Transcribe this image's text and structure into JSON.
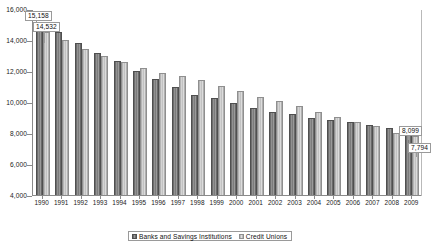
{
  "chart_data": {
    "type": "bar",
    "title": "",
    "xlabel": "",
    "ylabel": "",
    "ylim": [
      4000,
      16000
    ],
    "ytick_step": 2000,
    "ytick_labels": [
      "16,000",
      "14,000",
      "12,000",
      "10,000",
      "8,000",
      "6,000",
      "4,000"
    ],
    "ytick_values": [
      16000,
      14000,
      12000,
      10000,
      8000,
      6000,
      4000
    ],
    "grid": false,
    "legend_position": "bottom-center",
    "categories": [
      "1990",
      "1991",
      "1992",
      "1993",
      "1994",
      "1995",
      "1996",
      "1997",
      "1998",
      "1999",
      "2000",
      "2001",
      "2002",
      "2003",
      "2004",
      "2005",
      "2006",
      "2007",
      "2008",
      "2009"
    ],
    "series": [
      {
        "name": "Banks and Savings Institutions",
        "color": "#7c7c7c",
        "values": [
          15158,
          14500,
          13830,
          13170,
          12620,
          11990,
          11460,
          10960,
          10480,
          10230,
          9930,
          9630,
          9370,
          9200,
          8980,
          8830,
          8680,
          8540,
          8310,
          8099
        ]
      },
      {
        "name": "Credit Unions",
        "color": "#c8c8c8",
        "values": [
          14532,
          13980,
          13400,
          12960,
          12580,
          12220,
          11880,
          11670,
          11390,
          11040,
          10690,
          10350,
          10040,
          9730,
          9370,
          9040,
          8680,
          8430,
          7990,
          7794
        ]
      }
    ],
    "annotations": [
      {
        "label": "15,158",
        "series": "Banks and Savings Institutions",
        "category": "1990",
        "value": 15158
      },
      {
        "label": "14,532",
        "series": "Credit Unions",
        "category": "1990",
        "value": 14532
      },
      {
        "label": "8,099",
        "series": "Banks and Savings Institutions",
        "category": "2009",
        "value": 8099
      },
      {
        "label": "7,794",
        "series": "Credit Unions",
        "category": "2009",
        "value": 7794
      }
    ]
  },
  "legend": {
    "items": [
      {
        "label": "Banks and Savings Institutions",
        "swatch": "banks-swatch-icon"
      },
      {
        "label": "Credit Unions",
        "swatch": "credit-unions-swatch-icon"
      }
    ]
  }
}
